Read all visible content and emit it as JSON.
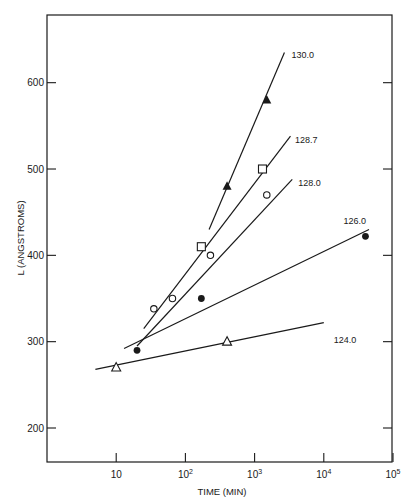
{
  "chart_data": {
    "type": "scatter",
    "title": "",
    "xlabel": "TIME (MIN)",
    "ylabel": "L (ANGSTROMS)",
    "xscale": "log",
    "xlim": [
      1,
      100000
    ],
    "ylim": [
      160,
      680
    ],
    "x_ticks": [
      {
        "value": 10,
        "label": "10",
        "exp": ""
      },
      {
        "value": 100,
        "label": "10",
        "exp": "2"
      },
      {
        "value": 1000,
        "label": "10",
        "exp": "3"
      },
      {
        "value": 10000,
        "label": "10",
        "exp": "4"
      },
      {
        "value": 100000,
        "label": "10",
        "exp": "5"
      }
    ],
    "y_ticks": [
      200,
      300,
      400,
      500,
      600
    ],
    "grid": false,
    "legend": "inline labels at line ends",
    "series": [
      {
        "name": "130.0",
        "marker": "filled-triangle",
        "points": [
          [
            400,
            480
          ],
          [
            1500,
            580
          ]
        ],
        "fit": [
          [
            220,
            430
          ],
          [
            2700,
            635
          ]
        ],
        "label_pos": [
          3200,
          632
        ]
      },
      {
        "name": "128.7",
        "marker": "open-square",
        "points": [
          [
            170,
            410
          ],
          [
            1300,
            500
          ]
        ],
        "fit": [
          [
            25,
            315
          ],
          [
            3300,
            538
          ]
        ],
        "label_pos": [
          3600,
          534
        ]
      },
      {
        "name": "128.0",
        "marker": "open-circle",
        "points": [
          [
            35,
            338
          ],
          [
            65,
            350
          ],
          [
            230,
            400
          ],
          [
            1500,
            470
          ]
        ],
        "fit": [
          [
            20,
            295
          ],
          [
            3500,
            488
          ]
        ],
        "label_pos": [
          4000,
          484
        ]
      },
      {
        "name": "126.0",
        "marker": "filled-circle",
        "points": [
          [
            20,
            290
          ],
          [
            170,
            350
          ],
          [
            40000,
            422
          ]
        ],
        "fit": [
          [
            13,
            292
          ],
          [
            45000,
            430
          ]
        ],
        "label_pos": [
          18000,
          440
        ]
      },
      {
        "name": "124.0",
        "marker": "open-triangle",
        "points": [
          [
            10,
            270
          ],
          [
            400,
            300
          ]
        ],
        "fit": [
          [
            5,
            268
          ],
          [
            10000,
            322
          ]
        ],
        "label_pos": [
          13000,
          302
        ]
      }
    ]
  }
}
